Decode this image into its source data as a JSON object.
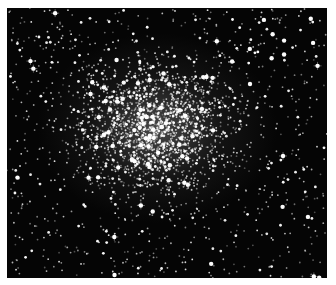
{
  "image": {
    "subject": "globular star cluster",
    "description": "Dense field of white stars on black background, concentrated toward the center-left",
    "background_color": "#050505",
    "star_color": "#ffffff",
    "border_color": "#ffffff"
  }
}
